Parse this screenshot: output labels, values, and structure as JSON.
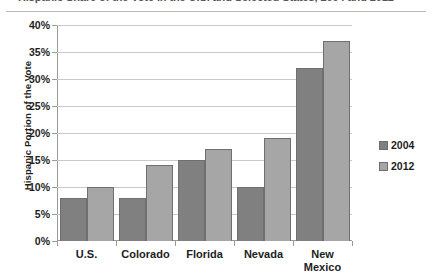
{
  "chart_data": {
    "type": "bar",
    "title": "Hispanic Share of the Vote in the U.S. and Selected States, 2004 and 2012",
    "xlabel": "",
    "ylabel": "Hispanic Portion of the Vote",
    "ylim": [
      0,
      40
    ],
    "ytick_labels": [
      "40%",
      "35%",
      "30%",
      "25%",
      "20%",
      "15%",
      "10%",
      "5%",
      "0%"
    ],
    "ytick_values": [
      40,
      35,
      30,
      25,
      20,
      15,
      10,
      5,
      0
    ],
    "grid": true,
    "legend_position": "right",
    "categories": [
      "U.S.",
      "Colorado",
      "Florida",
      "Nevada",
      "New Mexico"
    ],
    "category_lines": [
      [
        "U.S."
      ],
      [
        "Colorado"
      ],
      [
        "Florida"
      ],
      [
        "Nevada"
      ],
      [
        "New",
        "Mexico"
      ]
    ],
    "series": [
      {
        "name": "2004",
        "color": "#808080",
        "values": [
          8,
          8,
          15,
          10,
          32
        ]
      },
      {
        "name": "2012",
        "color": "#a6a6a6",
        "values": [
          10,
          14,
          17,
          19,
          37
        ]
      }
    ]
  },
  "legend": {
    "items": [
      {
        "label": "2004",
        "color": "#808080"
      },
      {
        "label": "2012",
        "color": "#a6a6a6"
      }
    ]
  }
}
